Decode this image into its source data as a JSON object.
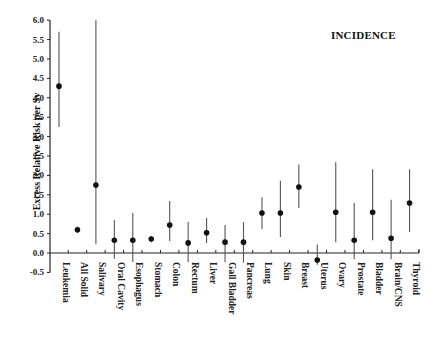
{
  "chart_data": {
    "type": "scatter",
    "subtype": "point-estimate-with-error-bars",
    "title": "INCIDENCE",
    "xlabel": "",
    "ylabel": "Excess Relative Risk per Sv",
    "ylim": [
      -0.5,
      6.0
    ],
    "yticks": [
      -0.5,
      0.0,
      0.5,
      1.0,
      1.5,
      2.0,
      2.5,
      3.0,
      3.5,
      4.0,
      4.5,
      5.0,
      5.5,
      6.0
    ],
    "ytick_labels": [
      "-0.5",
      "0.0",
      "0.5",
      "1.0",
      "1.5",
      "2.0",
      "2.5",
      "3.0",
      "3.5",
      "4.0",
      "4.5",
      "5.0",
      "5.5",
      "6.0"
    ],
    "grid": false,
    "legend": null,
    "categories": [
      "Leukemia",
      "All Solid",
      "Salivary",
      "Oral Cavity",
      "Esophagus",
      "Stomach",
      "Colon",
      "Rectum",
      "Liver",
      "Gall Bladder",
      "Pancreas",
      "Lung",
      "Skin",
      "Breast",
      "Uterus",
      "Ovary",
      "Prostate",
      "Bladder",
      "Brain/CNS",
      "Thyroid"
    ],
    "values": [
      4.3,
      0.6,
      1.75,
      0.33,
      0.33,
      0.36,
      0.72,
      0.26,
      0.52,
      0.28,
      0.28,
      1.03,
      1.03,
      1.7,
      -0.18,
      1.05,
      0.33,
      1.05,
      0.38,
      1.29
    ],
    "lower": [
      3.25,
      0.52,
      0.23,
      -0.15,
      -0.23,
      0.28,
      0.31,
      -0.23,
      0.26,
      -0.24,
      -0.25,
      0.62,
      0.41,
      1.16,
      -0.3,
      0.28,
      -0.16,
      0.33,
      -0.16,
      0.54
    ],
    "upper": [
      5.7,
      0.68,
      6.0,
      0.85,
      1.03,
      0.44,
      1.34,
      0.8,
      0.9,
      0.72,
      0.8,
      1.44,
      1.86,
      2.28,
      0.22,
      2.34,
      1.29,
      2.16,
      1.37,
      2.16
    ]
  },
  "colors": {
    "axis": "#222222",
    "point": "#111111",
    "errorbar": "#555555"
  }
}
